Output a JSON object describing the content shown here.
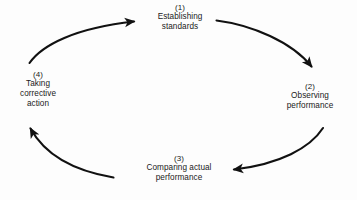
{
  "diagram": {
    "type": "cyclic-flow",
    "stroke_color": "#111111",
    "background_color": "#fdfdfd",
    "nodes": [
      {
        "index": "(1)",
        "lines": [
          "Establishing",
          "standards"
        ],
        "position": "top"
      },
      {
        "index": "(2)",
        "lines": [
          "Observing",
          "performance"
        ],
        "position": "right"
      },
      {
        "index": "(3)",
        "lines": [
          "Comparing actual",
          "performance"
        ],
        "position": "bottom"
      },
      {
        "index": "(4)",
        "lines": [
          "Taking",
          "corrective",
          "action"
        ],
        "position": "left"
      }
    ],
    "arrows": [
      {
        "name": "arrow-1-to-2",
        "from": "(1)",
        "to": "(2)",
        "direction": "clockwise"
      },
      {
        "name": "arrow-2-to-3",
        "from": "(2)",
        "to": "(3)",
        "direction": "clockwise"
      },
      {
        "name": "arrow-3-to-4",
        "from": "(3)",
        "to": "(4)",
        "direction": "clockwise"
      },
      {
        "name": "arrow-4-to-1",
        "from": "(4)",
        "to": "(1)",
        "direction": "clockwise"
      }
    ]
  }
}
